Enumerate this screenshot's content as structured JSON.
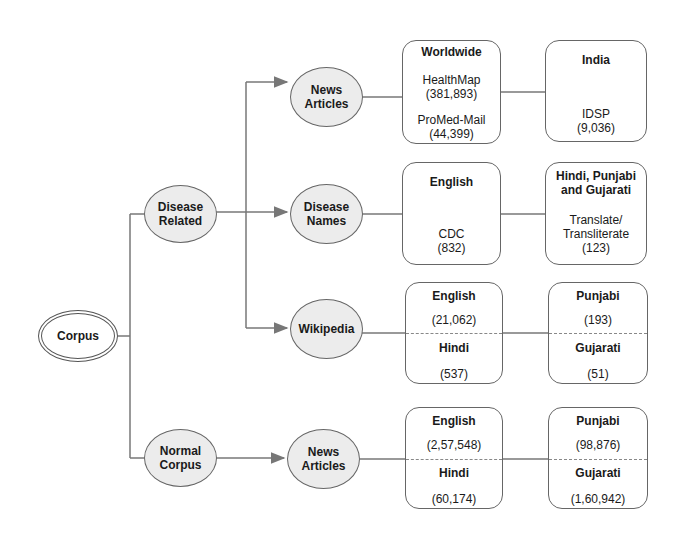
{
  "root": {
    "label": "Corpus"
  },
  "level1": {
    "disease_related": {
      "label_line1": "Disease",
      "label_line2": "Related"
    },
    "normal_corpus": {
      "label_line1": "Normal",
      "label_line2": "Corpus"
    }
  },
  "level2": {
    "news_articles": {
      "label_line1": "News",
      "label_line2": "Articles"
    },
    "disease_names": {
      "label_line1": "Disease",
      "label_line2": "Names"
    },
    "wikipedia": {
      "label": "Wikipedia"
    },
    "normal_news_articles": {
      "label_line1": "News",
      "label_line2": "Articles"
    }
  },
  "boxes": {
    "worldwide": {
      "title": "Worldwide",
      "src1": "HealthMap",
      "count1": "(381,893)",
      "src2": "ProMed-Mail",
      "count2": "(44,399)"
    },
    "india": {
      "title": "India",
      "src": "IDSP",
      "count": "(9,036)"
    },
    "english_names": {
      "title": "English",
      "src": "CDC",
      "count": "(832)"
    },
    "indic_names": {
      "title_line1": "Hindi, Punjabi",
      "title_line2": "and Gujarati",
      "src_line1": "Translate/",
      "src_line2": "Transliterate",
      "count": "(123)"
    },
    "wiki_en_hi": {
      "top_title": "English",
      "top_count": "(21,062)",
      "bottom_title": "Hindi",
      "bottom_count": "(537)"
    },
    "wiki_pa_gu": {
      "top_title": "Punjabi",
      "top_count": "(193)",
      "bottom_title": "Gujarati",
      "bottom_count": "(51)"
    },
    "normal_en_hi": {
      "top_title": "English",
      "top_count": "(2,57,548)",
      "bottom_title": "Hindi",
      "bottom_count": "(60,174)"
    },
    "normal_pa_gu": {
      "top_title": "Punjabi",
      "top_count": "(98,876)",
      "bottom_title": "Gujarati",
      "bottom_count": "(1,60,942)"
    }
  }
}
